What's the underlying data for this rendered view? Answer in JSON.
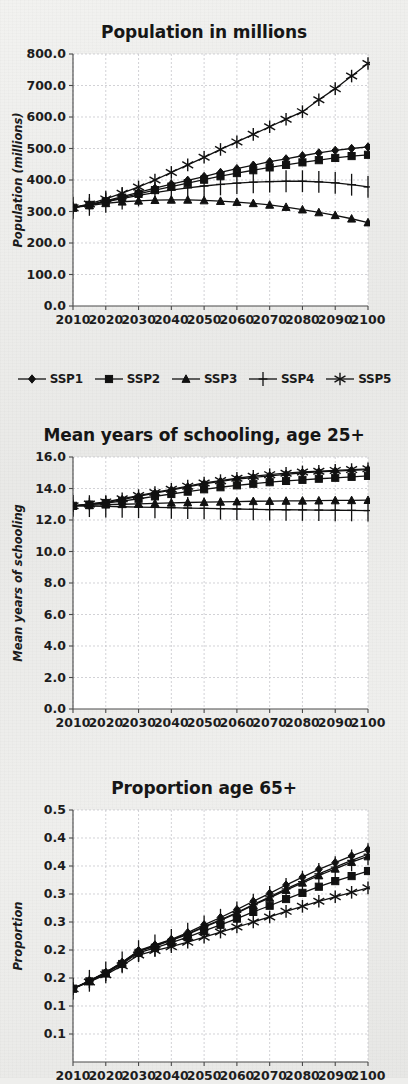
{
  "figure": {
    "background_color": "#eeeeec",
    "ink_color": "#111111",
    "grid_color": "#bfbfc4"
  },
  "legend": {
    "position": "below-first-panel",
    "items": [
      {
        "label": "SSP1",
        "marker": "diamond"
      },
      {
        "label": "SSP2",
        "marker": "square"
      },
      {
        "label": "SSP3",
        "marker": "triangle"
      },
      {
        "label": "SSP4",
        "marker": "plus"
      },
      {
        "label": "SSP5",
        "marker": "star"
      }
    ]
  },
  "chart_data": [
    {
      "id": "population",
      "type": "line",
      "title": "Population in millions",
      "xlabel": "",
      "ylabel": "Population (millions)",
      "x": [
        2010,
        2015,
        2020,
        2025,
        2030,
        2035,
        2040,
        2045,
        2050,
        2055,
        2060,
        2065,
        2070,
        2075,
        2080,
        2085,
        2090,
        2095,
        2100
      ],
      "xlim": [
        2010,
        2100
      ],
      "ylim": [
        0,
        800
      ],
      "xticks": [
        2010,
        2020,
        2030,
        2040,
        2050,
        2060,
        2070,
        2080,
        2090,
        2100
      ],
      "xticklabels": [
        "2010",
        "2020",
        "2030",
        "2040",
        "2050",
        "2060",
        "2070",
        "2080",
        "2090",
        "2100"
      ],
      "yticks": [
        0,
        100,
        200,
        300,
        400,
        500,
        600,
        700,
        800
      ],
      "yticklabels": [
        "0.0",
        "100.0",
        "200.0",
        "300.0",
        "400.0",
        "500.0",
        "600.0",
        "700.0",
        "800.0"
      ],
      "grid": true,
      "series": [
        {
          "name": "SSP1",
          "marker": "diamond",
          "values": [
            312,
            322,
            334,
            347,
            361,
            374,
            387,
            399,
            411,
            424,
            436,
            447,
            458,
            467,
            477,
            486,
            494,
            500,
            505
          ]
        },
        {
          "name": "SSP2",
          "marker": "square",
          "values": [
            312,
            321,
            332,
            344,
            356,
            368,
            379,
            390,
            401,
            412,
            422,
            431,
            440,
            448,
            456,
            463,
            470,
            476,
            480
          ]
        },
        {
          "name": "SSP3",
          "marker": "triangle",
          "values": [
            312,
            319,
            326,
            331,
            334,
            336,
            337,
            337,
            335,
            333,
            330,
            326,
            321,
            314,
            306,
            297,
            288,
            277,
            265
          ]
        },
        {
          "name": "SSP4",
          "marker": "plus",
          "values": [
            312,
            321,
            331,
            341,
            351,
            360,
            368,
            375,
            381,
            386,
            390,
            393,
            395,
            396,
            396,
            394,
            391,
            385,
            378
          ]
        },
        {
          "name": "SSP5",
          "marker": "star",
          "values": [
            312,
            324,
            340,
            358,
            378,
            400,
            424,
            448,
            472,
            497,
            521,
            545,
            569,
            593,
            617,
            655,
            690,
            730,
            770
          ]
        }
      ]
    },
    {
      "id": "schooling",
      "type": "line",
      "title": "Mean years of schooling, age 25+",
      "xlabel": "",
      "ylabel": "Mean years of schooling",
      "x": [
        2010,
        2015,
        2020,
        2025,
        2030,
        2035,
        2040,
        2045,
        2050,
        2055,
        2060,
        2065,
        2070,
        2075,
        2080,
        2085,
        2090,
        2095,
        2100
      ],
      "xlim": [
        2010,
        2100
      ],
      "ylim": [
        0,
        16
      ],
      "xticks": [
        2010,
        2020,
        2030,
        2040,
        2050,
        2060,
        2070,
        2080,
        2090,
        2100
      ],
      "xticklabels": [
        "2010",
        "2020",
        "2030",
        "2040",
        "2050",
        "2060",
        "2070",
        "2080",
        "2090",
        "2100"
      ],
      "yticks": [
        0,
        2,
        4,
        6,
        8,
        10,
        12,
        14,
        16
      ],
      "yticklabels": [
        "0.0",
        "2.0",
        "4.0",
        "6.0",
        "8.0",
        "10.0",
        "12.0",
        "14.0",
        "16.0"
      ],
      "grid": true,
      "series": [
        {
          "name": "SSP1",
          "marker": "diamond",
          "values": [
            12.9,
            13.0,
            13.1,
            13.3,
            13.5,
            13.7,
            13.9,
            14.1,
            14.3,
            14.45,
            14.6,
            14.7,
            14.8,
            14.9,
            15.0,
            15.05,
            15.1,
            15.15,
            15.2
          ]
        },
        {
          "name": "SSP2",
          "marker": "square",
          "values": [
            12.9,
            12.98,
            13.08,
            13.2,
            13.35,
            13.5,
            13.65,
            13.8,
            13.95,
            14.08,
            14.2,
            14.3,
            14.4,
            14.48,
            14.55,
            14.62,
            14.68,
            14.74,
            14.8
          ]
        },
        {
          "name": "SSP3",
          "marker": "triangle",
          "values": [
            12.9,
            12.93,
            12.97,
            13.0,
            13.03,
            13.06,
            13.09,
            13.11,
            13.13,
            13.15,
            13.17,
            13.19,
            13.2,
            13.21,
            13.22,
            13.23,
            13.24,
            13.25,
            13.26
          ]
        },
        {
          "name": "SSP4",
          "marker": "plus",
          "values": [
            12.9,
            12.88,
            12.86,
            12.84,
            12.82,
            12.8,
            12.78,
            12.76,
            12.74,
            12.72,
            12.7,
            12.68,
            12.66,
            12.65,
            12.64,
            12.63,
            12.62,
            12.61,
            12.6
          ]
        },
        {
          "name": "SSP5",
          "marker": "star",
          "values": [
            12.9,
            13.02,
            13.15,
            13.35,
            13.55,
            13.75,
            13.95,
            14.15,
            14.35,
            14.5,
            14.65,
            14.78,
            14.88,
            14.97,
            15.05,
            15.1,
            15.15,
            15.2,
            15.25
          ]
        }
      ]
    },
    {
      "id": "proportion",
      "type": "line",
      "title": "Proportion age 65+",
      "xlabel": "",
      "ylabel": "Proportion",
      "x": [
        2010,
        2015,
        2020,
        2025,
        2030,
        2035,
        2040,
        2045,
        2050,
        2055,
        2060,
        2065,
        2070,
        2075,
        2080,
        2085,
        2090,
        2095,
        2100
      ],
      "xlim": [
        2010,
        2100
      ],
      "ylim": [
        0.0,
        0.45
      ],
      "xticks": [
        2010,
        2020,
        2030,
        2040,
        2050,
        2060,
        2070,
        2080,
        2090,
        2100
      ],
      "xticklabels": [
        "2010",
        "2020",
        "2030",
        "2040",
        "2050",
        "2060",
        "2070",
        "2080",
        "2090",
        "2100"
      ],
      "yticks": [
        0.05,
        0.1,
        0.15,
        0.2,
        0.25,
        0.3,
        0.35,
        0.4,
        0.45
      ],
      "yticklabels": [
        "0.1",
        "0.1",
        "0.2",
        "0.2",
        "0.3",
        "0.3",
        "0.4",
        "0.4",
        "0.5"
      ],
      "grid": true,
      "series": [
        {
          "name": "SSP1",
          "marker": "diamond",
          "values": [
            0.131,
            0.145,
            0.16,
            0.178,
            0.199,
            0.209,
            0.219,
            0.231,
            0.245,
            0.258,
            0.272,
            0.287,
            0.301,
            0.316,
            0.33,
            0.344,
            0.356,
            0.368,
            0.379
          ]
        },
        {
          "name": "SSP2",
          "marker": "square",
          "values": [
            0.131,
            0.144,
            0.158,
            0.175,
            0.195,
            0.204,
            0.213,
            0.223,
            0.234,
            0.245,
            0.256,
            0.268,
            0.279,
            0.291,
            0.302,
            0.313,
            0.323,
            0.332,
            0.341
          ]
        },
        {
          "name": "SSP3",
          "marker": "triangle",
          "values": [
            0.131,
            0.145,
            0.159,
            0.177,
            0.197,
            0.207,
            0.217,
            0.228,
            0.241,
            0.253,
            0.266,
            0.28,
            0.293,
            0.307,
            0.32,
            0.333,
            0.345,
            0.357,
            0.367
          ]
        },
        {
          "name": "SSP4",
          "marker": "plus",
          "values": [
            0.131,
            0.145,
            0.16,
            0.178,
            0.198,
            0.208,
            0.218,
            0.229,
            0.242,
            0.254,
            0.267,
            0.281,
            0.295,
            0.309,
            0.322,
            0.336,
            0.348,
            0.36,
            0.371
          ]
        },
        {
          "name": "SSP5",
          "marker": "star",
          "values": [
            0.131,
            0.143,
            0.156,
            0.172,
            0.191,
            0.199,
            0.206,
            0.214,
            0.223,
            0.232,
            0.241,
            0.25,
            0.259,
            0.269,
            0.278,
            0.287,
            0.295,
            0.303,
            0.311
          ]
        }
      ]
    }
  ]
}
